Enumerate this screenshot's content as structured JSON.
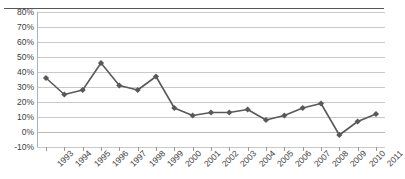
{
  "chart_data": {
    "type": "line",
    "title": "",
    "subtitle": "",
    "xlabel": "",
    "ylabel": "",
    "ylim": [
      -10,
      80
    ],
    "y_tick_labels": [
      "80%",
      "70%",
      "60%",
      "50%",
      "40%",
      "30%",
      "20%",
      "10%",
      "0%",
      "-10%"
    ],
    "y_tick_values": [
      80,
      70,
      60,
      50,
      40,
      30,
      20,
      10,
      0,
      -10
    ],
    "grid": "horizontal",
    "legend": "none",
    "marker": "diamond",
    "series_color": "#595959",
    "categories": [
      "1993",
      "1994",
      "1995",
      "1996",
      "1997",
      "1998",
      "1999",
      "2000",
      "2001",
      "2002",
      "2003",
      "2004",
      "2005",
      "2006",
      "2007",
      "2008",
      "2009",
      "2010",
      "2011"
    ],
    "values": [
      36,
      25,
      28,
      46,
      31,
      28,
      37,
      16,
      11,
      13,
      13,
      15,
      8,
      11,
      16,
      19,
      -2,
      7,
      12
    ],
    "series": [
      {
        "name": "Series 1",
        "values": [
          36,
          25,
          28,
          46,
          31,
          28,
          37,
          16,
          11,
          13,
          13,
          15,
          8,
          11,
          16,
          19,
          -2,
          7,
          12
        ]
      }
    ]
  }
}
